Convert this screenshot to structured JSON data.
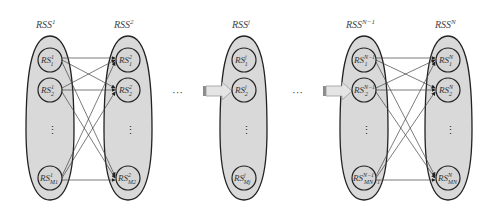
{
  "diagram": {
    "sets": [
      {
        "id": "rss1",
        "label_base": "RSS",
        "label_sup": "1",
        "cx": 50,
        "nodes": [
          {
            "base": "RS",
            "sup": "1",
            "sub": "1"
          },
          {
            "base": "RS",
            "sup": "1",
            "sub": "2"
          },
          {
            "base": "RS",
            "sup": "1",
            "sub": "M1"
          }
        ]
      },
      {
        "id": "rss2",
        "label_base": "RSS",
        "label_sup": "2",
        "cx": 128,
        "nodes": [
          {
            "base": "RS",
            "sup": "2",
            "sub": "1"
          },
          {
            "base": "RS",
            "sup": "2",
            "sub": "2"
          },
          {
            "base": "RS",
            "sup": "2",
            "sub": "M2"
          }
        ]
      },
      {
        "id": "rssj",
        "label_base": "RSS",
        "label_sup": "j",
        "cx": 244,
        "nodes": [
          {
            "base": "RS",
            "sup": "j",
            "sub": "1"
          },
          {
            "base": "RS",
            "sup": "j",
            "sub": "2"
          },
          {
            "base": "RS",
            "sup": "j",
            "sub": "Mj"
          }
        ]
      },
      {
        "id": "rssn1",
        "label_base": "RSS",
        "label_sup": "N−1",
        "cx": 364,
        "nodes": [
          {
            "base": "RS",
            "sup": "N−1",
            "sub": "1"
          },
          {
            "base": "RS",
            "sup": "N−1",
            "sub": "2"
          },
          {
            "base": "RS",
            "sup": "N−1",
            "sub": "MN−1"
          }
        ]
      },
      {
        "id": "rssn",
        "label_base": "RSS",
        "label_sup": "N",
        "cx": 448,
        "nodes": [
          {
            "base": "RS",
            "sup": "N",
            "sub": "1"
          },
          {
            "base": "RS",
            "sup": "N",
            "sub": "2"
          },
          {
            "base": "RS",
            "sup": "N",
            "sub": "MN"
          }
        ]
      }
    ],
    "vertical_ellipsis": "⋮",
    "horizontal_ellipsis": "···",
    "colors": {
      "set_fill": "#d9d9d9",
      "node_fill": "#d6d6d6",
      "stroke": "#222222",
      "edge": "#444444",
      "block_arrow": "#e4e4e4"
    }
  }
}
